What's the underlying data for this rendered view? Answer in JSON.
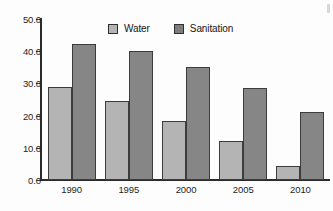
{
  "chart_data": {
    "type": "bar",
    "title": "",
    "xlabel": "",
    "ylabel": "",
    "categories": [
      "1990",
      "1995",
      "2000",
      "2005",
      "2010"
    ],
    "series": [
      {
        "name": "Water",
        "values": [
          29.0,
          24.5,
          18.3,
          12.0,
          4.5
        ],
        "color": "#b4b4b4"
      },
      {
        "name": "Sanitation",
        "values": [
          42.3,
          40.0,
          35.0,
          28.5,
          21.0
        ],
        "color": "#868686"
      }
    ],
    "ylim": [
      0.0,
      50.0
    ],
    "yticks": [
      0.0,
      10.0,
      20.0,
      30.0,
      40.0,
      50.0
    ],
    "ytick_labels": [
      "0.0",
      "10.0",
      "20.0",
      "30.0",
      "40.0",
      "50.0"
    ],
    "grid": false,
    "legend_position": "top-center",
    "legend_entries": [
      "Water",
      "Sanitation"
    ]
  },
  "axis": {
    "y_labels": [
      "50.0",
      "40.0",
      "30.0",
      "20.0",
      "10.0",
      "0.0"
    ],
    "x_labels": [
      "1990",
      "1995",
      "2000",
      "2005",
      "2010"
    ]
  },
  "legend": {
    "items": [
      {
        "label": "Water",
        "swatch": "legend-swatch-water"
      },
      {
        "label": "Sanitation",
        "swatch": "legend-swatch-sanitation"
      }
    ]
  }
}
